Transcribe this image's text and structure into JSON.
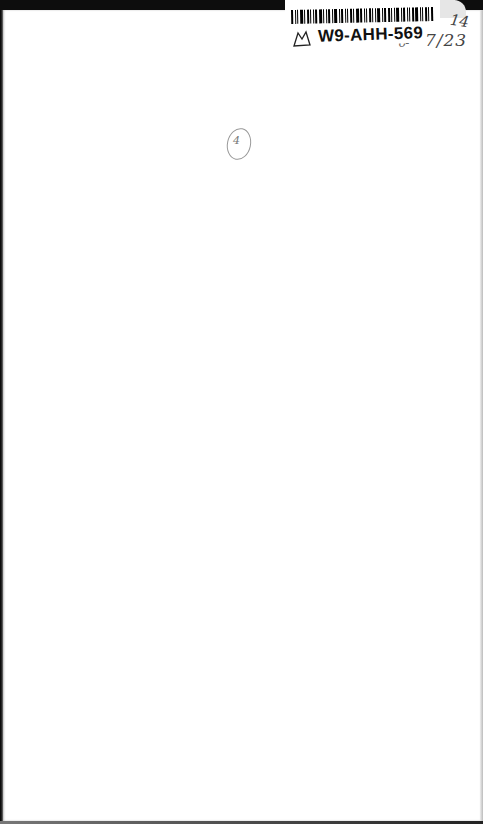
{
  "document": {
    "type": "scanned blank page",
    "label": {
      "call_number": "W9-AHH-569",
      "barcode_icon": "barcode-icon",
      "logo_icon": "book-logo-icon"
    },
    "annotations": {
      "top_right_number": "14",
      "date_mark": "7/23",
      "small_mark": "ᴗ-",
      "circled_note": "4"
    }
  },
  "colors": {
    "page": "#ffffff",
    "border": "#0d0d0d",
    "ink": "#111111",
    "pencil": "#555555"
  }
}
